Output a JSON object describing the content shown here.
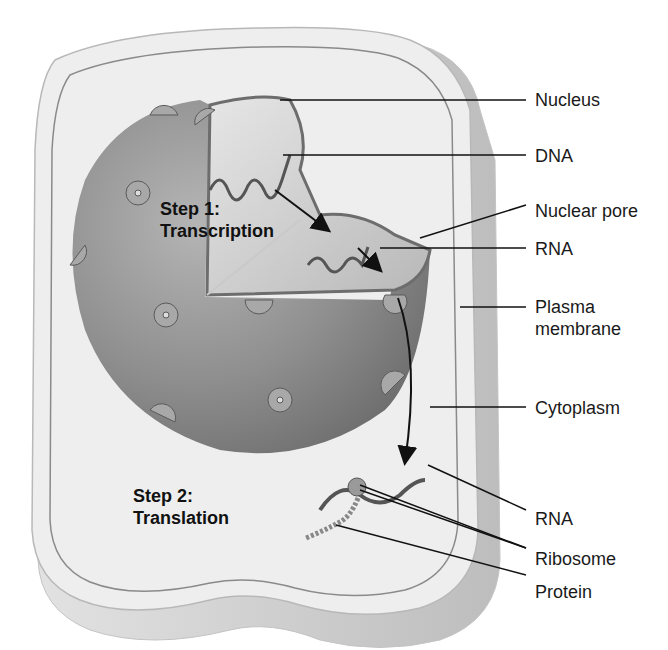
{
  "figure": {
    "steps": [
      {
        "line1": "Step 1:",
        "line2": "Transcription"
      },
      {
        "line1": "Step 2:",
        "line2": "Translation"
      }
    ],
    "labels": [
      {
        "id": "nucleus",
        "text": "Nucleus"
      },
      {
        "id": "dna",
        "text": "DNA"
      },
      {
        "id": "nuclear-pore",
        "text": "Nuclear pore"
      },
      {
        "id": "rna-nucleus",
        "text": "RNA"
      },
      {
        "id": "plasma-membrane",
        "line1": "Plasma",
        "line2": "membrane"
      },
      {
        "id": "cytoplasm",
        "text": "Cytoplasm"
      },
      {
        "id": "rna-cytoplasm",
        "text": "RNA"
      },
      {
        "id": "ribosome",
        "text": "Ribosome"
      },
      {
        "id": "protein",
        "text": "Protein"
      }
    ]
  },
  "colors": {
    "background": "#ffffff",
    "cell_fill": "#eeeeee",
    "cell_edge": "#c8c8c8",
    "membrane_line": "#8a8a8a",
    "nucleus_dark": "#8c8c8c",
    "nucleus_light": "#d6d6d6",
    "leader_line": "#111111"
  }
}
